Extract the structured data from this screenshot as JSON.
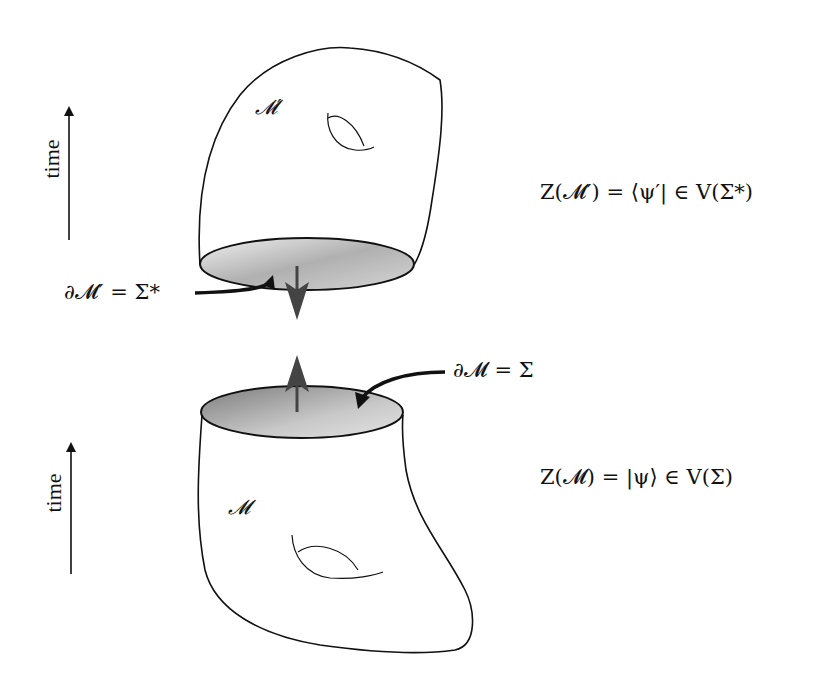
{
  "diagram": {
    "type": "cobordism-gluing",
    "upper_manifold": {
      "label": "𝓜′",
      "boundary_label": "∂𝓜′ = Σ*",
      "state_equation": "Z(𝓜′) = ⟨ψ′| ∈ V(Σ*)",
      "time_axis_label": "time",
      "boundary_orientation": "down"
    },
    "lower_manifold": {
      "label": "𝓜",
      "boundary_label": "∂𝓜 = Σ",
      "state_equation": "Z(𝓜) = |ψ⟩ ∈ V(Σ)",
      "time_axis_label": "time",
      "boundary_orientation": "up"
    },
    "colors": {
      "outline": "#111111",
      "disk_fill_light": "#e6e6e6",
      "disk_fill_dark": "#8a8a8a",
      "arrow": "#444444"
    }
  }
}
